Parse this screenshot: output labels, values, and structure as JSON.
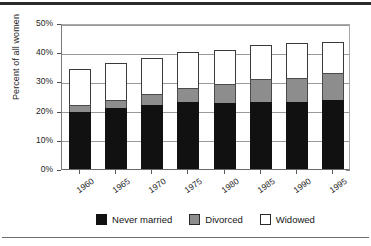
{
  "chart_data": {
    "type": "bar",
    "subtype": "stacked",
    "title": "",
    "xlabel": "",
    "ylabel": "Percent of all women",
    "categories": [
      "1960",
      "1965",
      "1970",
      "1975",
      "1980",
      "1985",
      "1990",
      "1995"
    ],
    "series": [
      {
        "name": "Never married",
        "color": "#111111",
        "values": [
          19.5,
          20.8,
          22.0,
          23.1,
          22.5,
          22.8,
          22.8,
          23.5
        ]
      },
      {
        "name": "Divorced",
        "color": "#8d8d8d",
        "values": [
          2.5,
          2.9,
          3.7,
          4.8,
          6.5,
          7.9,
          8.5,
          9.3
        ]
      },
      {
        "name": "Widowed",
        "color": "#ffffff",
        "values": [
          12.2,
          12.5,
          12.4,
          12.1,
          11.8,
          11.9,
          11.7,
          10.8
        ]
      }
    ],
    "totals": [
      34.2,
      36.2,
      38.1,
      40.0,
      40.8,
      42.6,
      43.0,
      43.6
    ],
    "ylim": [
      0,
      50
    ],
    "yticks": [
      "0%",
      "10%",
      "20%",
      "30%",
      "40%",
      "50%"
    ],
    "ytick_values": [
      0,
      10,
      20,
      30,
      40,
      50
    ],
    "grid": true,
    "grid_axis": "y",
    "legend_position": "bottom"
  },
  "legend": {
    "items": [
      {
        "label": "Never married"
      },
      {
        "label": "Divorced"
      },
      {
        "label": "Widowed"
      }
    ]
  }
}
